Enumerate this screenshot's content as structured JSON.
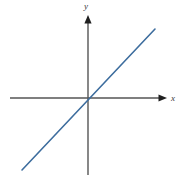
{
  "figure": {
    "width": 182,
    "height": 175,
    "background_color": "#ffffff"
  },
  "axes": {
    "x_axis": {
      "label": "x",
      "color": "#555555",
      "stroke_width": 1.4,
      "start_px": [
        10,
        98
      ],
      "end_px": [
        167,
        98
      ],
      "arrowhead": "right",
      "arrow_icon": "arrow-right-icon",
      "label_px": [
        171,
        101
      ]
    },
    "y_axis": {
      "label": "y",
      "color": "#555555",
      "stroke_width": 1.4,
      "start_px": [
        88,
        175
      ],
      "end_px": [
        88,
        15
      ],
      "arrowhead": "up",
      "arrow_icon": "arrow-up-icon",
      "label_px": [
        86,
        9
      ]
    },
    "origin_px": [
      88,
      98
    ]
  },
  "chart_data": {
    "type": "line",
    "title": "",
    "subtitle": "",
    "xlabel": "x",
    "ylabel": "y",
    "grid": false,
    "legend": null,
    "legend_position": "none",
    "axis_style": "cartesian-arrows",
    "xlim": [
      -5.8,
      5.0
    ],
    "ylim": [
      -5.0,
      5.5
    ],
    "series": [
      {
        "name": "y = x",
        "color": "#3d6d9e",
        "stroke_width": 1.6,
        "slope": 1,
        "intercept": 0,
        "x": [
          -4.6,
          4.5
        ],
        "values": [
          -4.6,
          4.5
        ],
        "endpoints_px": [
          [
            22,
            170
          ],
          [
            155,
            29
          ]
        ],
        "passes_through_origin": true
      }
    ],
    "annotations": []
  }
}
